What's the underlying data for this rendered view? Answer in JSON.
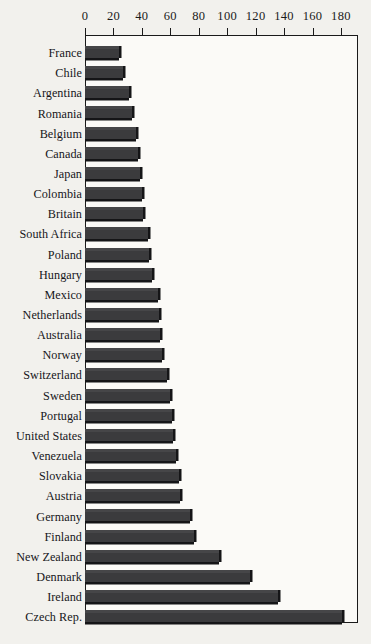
{
  "chart_data": {
    "type": "bar",
    "orientation": "horizontal",
    "title": "",
    "subtitle": "",
    "xlabel": "",
    "ylabel": "",
    "xlim": [
      0,
      192
    ],
    "xticks": [
      0,
      20,
      40,
      60,
      80,
      100,
      120,
      140,
      160,
      180
    ],
    "tick_labels": [
      "0",
      "20",
      "40",
      "60",
      "80",
      "100",
      "120",
      "140",
      "160",
      "180"
    ],
    "grid": false,
    "legend": false,
    "legend_position": "none",
    "bar_color": "#3b3b3d",
    "shadow_color": "#151517",
    "frame_color": "#1a1a1a",
    "background_color": "#f2f1ed",
    "plot_background_color": "#fbfaf7",
    "categories": [
      "France",
      "Chile",
      "Argentina",
      "Romania",
      "Belgium",
      "Canada",
      "Japan",
      "Colombia",
      "Britain",
      "South Africa",
      "Poland",
      "Hungary",
      "Mexico",
      "Netherlands",
      "Australia",
      "Norway",
      "Switzerland",
      "Sweden",
      "Portugal",
      "United States",
      "Venezuela",
      "Slovakia",
      "Austria",
      "Germany",
      "Finland",
      "New Zealand",
      "Denmark",
      "Ireland",
      "Czech Rep."
    ],
    "values": [
      24,
      27,
      31,
      33,
      36,
      37,
      39,
      40,
      41,
      44,
      45,
      47,
      51,
      52,
      53,
      54,
      58,
      60,
      61,
      62,
      64,
      66,
      67,
      74,
      77,
      94,
      116,
      136,
      181
    ]
  }
}
